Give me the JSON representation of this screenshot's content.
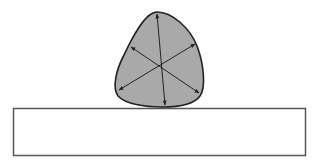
{
  "diagram": {
    "shape": {
      "kind": "curved-triangle",
      "fill_color": "#a9a9a9",
      "stroke_color": "#222222",
      "diameter_arrow_count": 3,
      "arrow_color": "#222222"
    },
    "surface": {
      "kind": "rectangle",
      "fill_color": "#ffffff",
      "stroke_color": "#555555"
    }
  }
}
